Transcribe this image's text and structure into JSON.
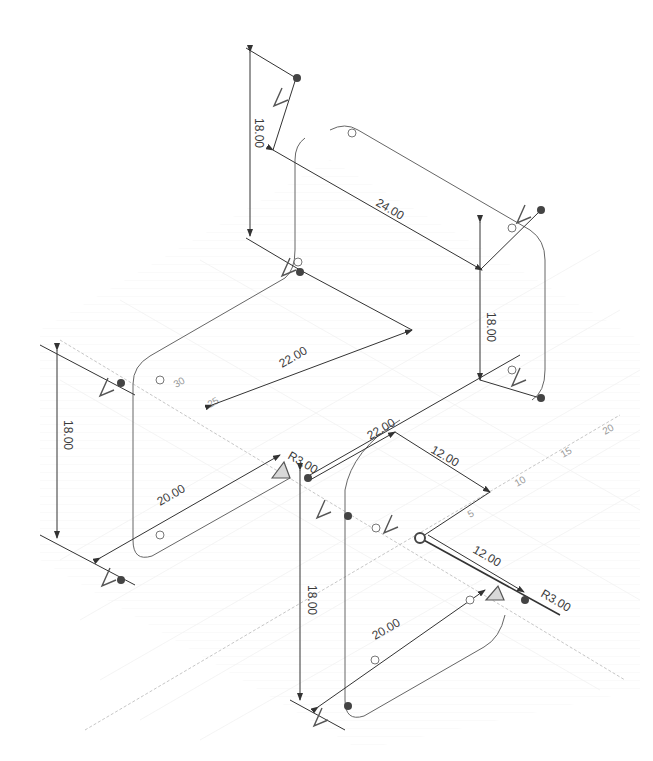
{
  "viewport": {
    "title_clipped": "",
    "background": "#ffffff",
    "line_color": "#3a3a3a",
    "grid_color": "#e4e4e4",
    "point_color": "#444444"
  },
  "dimensions": {
    "top_left_height": "18.00",
    "top_width": "24.00",
    "top_right_height": "18.00",
    "mid_length": "22.00",
    "left_height": "18.00",
    "left_depth": "20.00",
    "center_length": "22.00",
    "center_offset": "12.00",
    "bottom_offset": "12.00",
    "bottom_height": "18.00",
    "bottom_depth": "20.00",
    "radius_center": "R3.00",
    "radius_bottom": "R3.00"
  },
  "axis_ticks": {
    "t5": "5",
    "t10": "10",
    "t15": "15",
    "t20": "20",
    "t25": "25",
    "t30": "30"
  }
}
